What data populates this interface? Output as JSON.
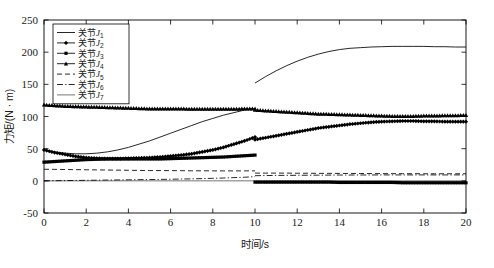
{
  "figure": {
    "background": "#ffffff",
    "axis_color": "#000000",
    "line_color": "#000000"
  },
  "axes": {
    "x_title": "时间/s",
    "y_title": "力矩/(N · m)",
    "x_ticks": [
      "0",
      "2",
      "4",
      "6",
      "8",
      "10",
      "12",
      "14",
      "16",
      "18",
      "20"
    ],
    "y_ticks": [
      "-50",
      "0",
      "50",
      "100",
      "150",
      "200",
      "250"
    ]
  },
  "legend": {
    "entries": [
      {
        "label_cn": "关节",
        "symbol": "J",
        "sub": "1",
        "style": "solid"
      },
      {
        "label_cn": "关节",
        "symbol": "J",
        "sub": "2",
        "style": "solid-diamond"
      },
      {
        "label_cn": "关节",
        "symbol": "J",
        "sub": "3",
        "style": "solid-square"
      },
      {
        "label_cn": "关节",
        "symbol": "J",
        "sub": "4",
        "style": "solid-triangle"
      },
      {
        "label_cn": "关节",
        "symbol": "J",
        "sub": "5",
        "style": "dashed"
      },
      {
        "label_cn": "关节",
        "symbol": "J",
        "sub": "6",
        "style": "dashdot"
      },
      {
        "label_cn": "关节",
        "symbol": "J",
        "sub": "7",
        "style": "thin-solid"
      }
    ]
  },
  "chart_data": {
    "type": "line",
    "title": "",
    "xlabel": "时间/s",
    "ylabel": "力矩/(N · m)",
    "xlim": [
      0,
      20
    ],
    "ylim": [
      -50,
      250
    ],
    "xticks": [
      0,
      2,
      4,
      6,
      8,
      10,
      12,
      14,
      16,
      18,
      20
    ],
    "yticks": [
      -50,
      0,
      50,
      100,
      150,
      200,
      250
    ],
    "grid": false,
    "legend_position": "upper-left",
    "discontinuity_x": 10,
    "x": [
      0,
      0.5,
      1,
      1.5,
      2,
      2.5,
      3,
      3.5,
      4,
      4.5,
      5,
      5.5,
      6,
      6.5,
      7,
      7.5,
      8,
      8.5,
      9,
      9.5,
      10,
      10,
      10.5,
      11,
      11.5,
      12,
      12.5,
      13,
      13.5,
      14,
      14.5,
      15,
      15.5,
      16,
      16.5,
      17,
      17.5,
      18,
      18.5,
      19,
      19.5,
      20
    ],
    "series": [
      {
        "name": "关节J1",
        "style": "solid",
        "marker": "none",
        "values": [
          48,
          45,
          43,
          42,
          42,
          43,
          45,
          48,
          52,
          57,
          62,
          68,
          74,
          80,
          86,
          92,
          97,
          102,
          106,
          110,
          112,
          152,
          162,
          171,
          179,
          186,
          192,
          197,
          201,
          204,
          206,
          207,
          208,
          208.5,
          209,
          209,
          209,
          209,
          208.5,
          208.5,
          208,
          208
        ]
      },
      {
        "name": "关节J2",
        "style": "solid",
        "marker": "diamond",
        "values": [
          48,
          44,
          41,
          38,
          36,
          35,
          34.5,
          34.5,
          35,
          35.5,
          36,
          37,
          38.5,
          40,
          42,
          45,
          48,
          52,
          57,
          62,
          68,
          64,
          67,
          70,
          73,
          76,
          79,
          82,
          84,
          86,
          88,
          89.5,
          91,
          92,
          92.5,
          93,
          93,
          92.5,
          92.5,
          92,
          92,
          92
        ]
      },
      {
        "name": "关节J3",
        "style": "solid",
        "marker": "square",
        "values": [
          29,
          30,
          31,
          32,
          33,
          33.5,
          34,
          34,
          34,
          34,
          34,
          34,
          34.5,
          35,
          35.5,
          36,
          36.5,
          37,
          38,
          39,
          40,
          -2,
          -2,
          -2,
          -2,
          -2,
          -2,
          -2,
          -2,
          -2.5,
          -2.5,
          -2.5,
          -2.5,
          -2.5,
          -2.5,
          -3,
          -3,
          -3,
          -3,
          -3,
          -3,
          -3
        ]
      },
      {
        "name": "关节J4",
        "style": "solid",
        "marker": "triangle",
        "values": [
          118,
          117,
          116,
          115.5,
          115,
          114.5,
          114,
          113.5,
          113,
          112.5,
          112,
          112,
          112,
          112,
          111.5,
          111.5,
          111.5,
          111.5,
          111.5,
          112,
          112,
          110,
          109,
          108,
          107,
          106,
          105,
          104,
          103.5,
          103,
          102.5,
          102,
          101.5,
          101,
          100.5,
          100.5,
          100.5,
          101,
          101,
          101.5,
          101.5,
          102
        ]
      },
      {
        "name": "关节J5",
        "style": "dashed",
        "marker": "none",
        "values": [
          18,
          17.8,
          17.6,
          17.4,
          17.2,
          17,
          16.8,
          16.6,
          16.4,
          16.2,
          16,
          16,
          15.8,
          15.8,
          15.6,
          15.6,
          15.5,
          15.5,
          15.5,
          15.5,
          15.5,
          12,
          12,
          12,
          12,
          11.8,
          11.8,
          11.6,
          11.6,
          11.5,
          11.5,
          11.4,
          11.3,
          11.2,
          11.2,
          11.1,
          11.1,
          11,
          11,
          11,
          11,
          11
        ]
      },
      {
        "name": "关节J6",
        "style": "dashdot",
        "marker": "none",
        "values": [
          0,
          0.2,
          0.4,
          0.6,
          0.8,
          1,
          1.2,
          1.4,
          1.6,
          1.8,
          2,
          2.2,
          2.5,
          2.8,
          3.1,
          3.5,
          3.9,
          4.4,
          5,
          5.6,
          6.5,
          8,
          8.2,
          8.4,
          8.5,
          8.6,
          8.7,
          8.8,
          8.9,
          9,
          9,
          9.1,
          9.1,
          9.2,
          9.2,
          9.2,
          9.2,
          9.2,
          9.2,
          9.2,
          9.2,
          9.2
        ]
      },
      {
        "name": "关节J7",
        "style": "thin-solid",
        "marker": "none",
        "values": [
          0,
          0,
          0,
          0,
          0,
          0,
          0,
          0,
          0,
          0,
          0,
          0,
          0,
          0,
          0,
          0,
          0,
          0,
          0,
          0,
          0,
          0,
          0,
          0,
          0,
          0,
          0,
          0,
          0,
          0,
          0,
          0,
          0,
          0,
          0,
          0,
          0,
          0,
          0,
          0,
          0,
          0
        ]
      }
    ]
  }
}
